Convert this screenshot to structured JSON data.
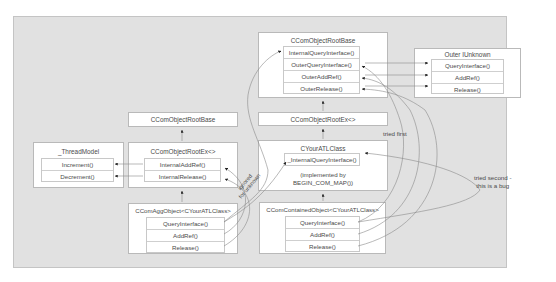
{
  "diagram": {
    "boxes": {
      "root_base_top": {
        "title": "CComObjectRootBase",
        "methods": [
          "InternalQueryInterface()",
          "OuterQueryInterface()",
          "OuterAddRef()",
          "OuterRelease()"
        ]
      },
      "outer_iunknown": {
        "title": "Outer IUnknown",
        "methods": [
          "QueryInterface()",
          "AddRef()",
          "Release()"
        ]
      },
      "root_ex_right": {
        "title": "CComObjectRootEx<>"
      },
      "root_base_left": {
        "title": "CComObjectRootBase"
      },
      "thread_model": {
        "title": "_ThreadModel",
        "methods": [
          "Increment()",
          "Decrement()"
        ]
      },
      "root_ex_left": {
        "title": "CComObjectRootEx<>",
        "methods": [
          "InternalAddRef()",
          "InternalRelease()"
        ]
      },
      "your_atl_class": {
        "title": "CYourATLClass",
        "methods": [
          "_InternalQueryInterface()"
        ],
        "note_line1": "(implemented by",
        "note_line2": "BEGIN_COM_MAP())"
      },
      "agg_object": {
        "title": "CComAggObject<CYourATLClass>",
        "methods": [
          "QueryInterface()",
          "AddRef()",
          "Release()"
        ]
      },
      "contained_object": {
        "title": "CComContainedObject<CYourATLClass>",
        "methods": [
          "QueryInterface()",
          "AddRef()",
          "Release()"
        ]
      }
    },
    "annotations": {
      "tried_first": "tried first",
      "tried_second_line1": "tried second -",
      "tried_second_line2": "this is a bug",
      "ignored_line1": "ignored",
      "ignored_line2": "for unknown"
    },
    "colors": {
      "panel": "#e1e1e1",
      "box": "#ffffff",
      "line": "#7a7a7a",
      "text": "#4a4a4a"
    }
  }
}
